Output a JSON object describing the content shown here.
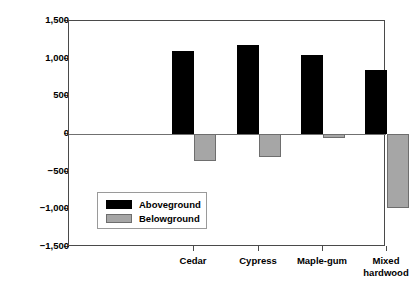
{
  "chart_data": {
    "type": "bar",
    "title": "",
    "subtitle": "",
    "xlabel": "",
    "ylabel": "NPP (g m-2 yr-1)",
    "ylabel_parts": {
      "prefix": "NPP (g m",
      "exp1": "−2",
      "mid": " yr",
      "exp2": "−1",
      "suffix": ")"
    },
    "categories": [
      "Cedar",
      "Cypress",
      "Maple-gum",
      "Mixed\nhardwood"
    ],
    "series": [
      {
        "name": "Aboveground",
        "color": "#000000",
        "values": [
          1100,
          1180,
          1050,
          845
        ]
      },
      {
        "name": "Belowground",
        "color": "#a6a6a6",
        "values": [
          -360,
          -300,
          -55,
          -980
        ]
      }
    ],
    "ylim": [
      -1500,
      1500
    ],
    "yticks": [
      1500,
      1000,
      500,
      0,
      -500,
      -1000,
      -1500
    ],
    "ytick_labels": [
      "1,500",
      "1,000",
      "500",
      "0",
      "−500",
      "−1,000",
      "−1,500"
    ],
    "grid": false,
    "zero_line": true,
    "legend_position": "inside-lower-left",
    "legend_entries": [
      "Aboveground",
      "Belowground"
    ],
    "frame_color": "#4a4a4a",
    "background": "#ffffff"
  },
  "layout": {
    "plot_left": 68,
    "plot_top": 20,
    "plot_width": 317,
    "plot_height": 226,
    "zero_y": 113,
    "px_per_unit": 0.0753,
    "bar_width": 22,
    "group_centers": [
      125,
      190,
      254,
      318
    ],
    "above_offset": -11,
    "below_offset": 11
  }
}
